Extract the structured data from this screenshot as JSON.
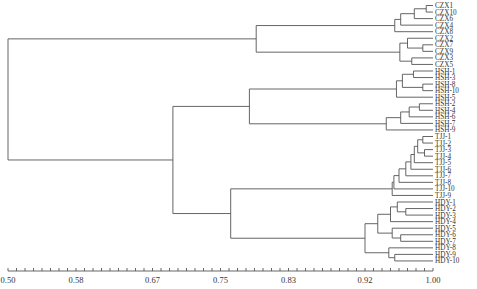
{
  "chart_data": {
    "type": "dendrogram",
    "title": "",
    "xlabel": "",
    "ylabel": "",
    "axis": {
      "min": 0.5,
      "max": 1.0,
      "tick_labels": [
        "0.50",
        "0.58",
        "0.67",
        "0.75",
        "0.83",
        "0.92",
        "1.00"
      ],
      "tick_values": [
        0.5,
        0.58,
        0.67,
        0.75,
        0.83,
        0.92,
        1.0
      ],
      "minor_ticks": 50
    },
    "leaves": [
      "CZX1",
      "CZX10",
      "CZX6",
      "CZX4",
      "CZX8",
      "CZX2",
      "CZX7",
      "CZX9",
      "CZX3",
      "CZX5",
      "HSH-1",
      "HSH-3",
      "HSH-8",
      "HSH-10",
      "HSH-5",
      "HSH-2",
      "HSH-4",
      "HSH-6",
      "HSH-7",
      "HSH-9",
      "TJJ-1",
      "TJJ-2",
      "TJJ-3",
      "TJJ-4",
      "TJJ-5",
      "TJJ-6",
      "TJJ-7",
      "TJJ-8",
      "TJJ-10",
      "TJJ-9",
      "HDY-1",
      "HDY-2",
      "HDY-3",
      "HDY-4",
      "HDY-5",
      "HDY-6",
      "HDY-7",
      "HDY-8",
      "HDY-9",
      "HDY-10"
    ],
    "merges": [
      {
        "children": [
          "CZX1",
          "CZX10"
        ],
        "similarity": 0.992
      },
      {
        "children": [
          "CZX1+CZX10",
          "CZX6"
        ],
        "similarity": 0.978
      },
      {
        "children": [
          "...",
          "CZX4"
        ],
        "similarity": 0.962
      },
      {
        "children": [
          "...",
          "CZX8"
        ],
        "similarity": 0.955
      },
      {
        "children": [
          "CZX7",
          "CZX9"
        ],
        "similarity": 0.988
      },
      {
        "children": [
          "CZX2",
          "CZX7+CZX9"
        ],
        "similarity": 0.97
      },
      {
        "children": [
          "CZX3",
          "CZX5"
        ],
        "similarity": 0.975
      },
      {
        "children": [
          "CZX2-group",
          "CZX3-group"
        ],
        "similarity": 0.961
      },
      {
        "children": [
          "CZX-A",
          "CZX-B"
        ],
        "similarity": 0.792
      },
      {
        "children": [
          "HSH-1",
          "HSH-3"
        ],
        "similarity": 0.977
      },
      {
        "children": [
          "HSH-8",
          "HSH-10"
        ],
        "similarity": 0.988
      },
      {
        "children": [
          "HSH-1/3",
          "HSH-8/10"
        ],
        "similarity": 0.964
      },
      {
        "children": [
          "...",
          "HSH-5"
        ],
        "similarity": 0.957
      },
      {
        "children": [
          "HSH-2",
          "HSH-4"
        ],
        "similarity": 0.984
      },
      {
        "children": [
          "...",
          "HSH-6"
        ],
        "similarity": 0.972
      },
      {
        "children": [
          "...",
          "HSH-7"
        ],
        "similarity": 0.962
      },
      {
        "children": [
          "...",
          "HSH-9"
        ],
        "similarity": 0.945
      },
      {
        "children": [
          "HSH-A",
          "HSH-B"
        ],
        "similarity": 0.784
      },
      {
        "children": [
          "TJJ-1..TJJ-8"
        ],
        "similarity": 0.96
      },
      {
        "children": [
          "TJJ",
          "TJJ-10"
        ],
        "similarity": 0.954
      },
      {
        "children": [
          "...",
          "TJJ-9"
        ],
        "similarity": 0.952
      },
      {
        "children": [
          "HDY-1..HDY-10"
        ],
        "similarity": 0.92
      },
      {
        "children": [
          "TJJ",
          "HDY"
        ],
        "similarity": 0.762
      },
      {
        "children": [
          "HSH",
          "TJJ+HDY"
        ],
        "similarity": 0.694
      },
      {
        "children": [
          "CZX",
          "HSH+TJJ+HDY"
        ],
        "similarity": 0.5
      }
    ],
    "groups": [
      "CZX",
      "HSH",
      "TJJ",
      "HDY"
    ],
    "grid": false
  }
}
